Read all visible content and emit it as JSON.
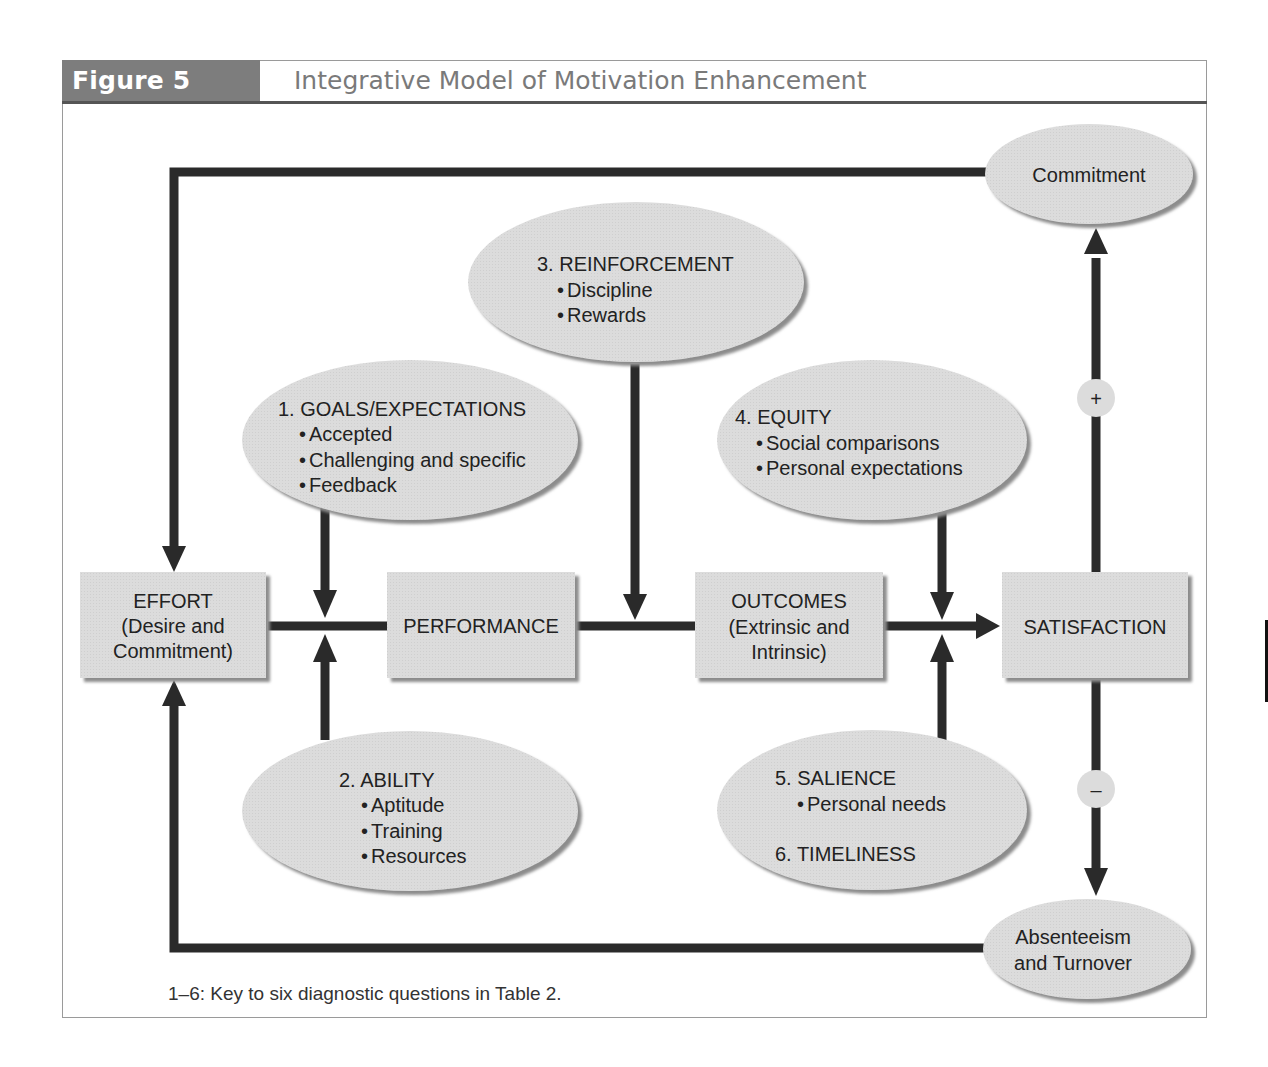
{
  "figure": {
    "label": "Figure 5",
    "title": "Integrative Model of Motivation Enhancement",
    "footnote": "1–6: Key to six diagnostic questions in Table 2."
  },
  "colors": {
    "node_fill": "#dcdcdc",
    "node_shadow": "#8c8c8c",
    "arrow": "#2a2a2a",
    "header_fill": "#7d7d7d",
    "title_text": "#7a7a7a"
  },
  "boxes": {
    "effort": {
      "lines": [
        "EFFORT",
        "(Desire and",
        "Commitment)"
      ]
    },
    "performance": {
      "lines": [
        "PERFORMANCE"
      ]
    },
    "outcomes": {
      "lines": [
        "OUTCOMES",
        "(Extrinsic and",
        "Intrinsic)"
      ]
    },
    "satisfaction": {
      "lines": [
        "SATISFACTION"
      ]
    }
  },
  "ellipses": {
    "commitment": {
      "lines": [
        "Commitment"
      ]
    },
    "absenteeism": {
      "lines": [
        "Absenteeism",
        "and Turnover"
      ]
    },
    "goals": {
      "heading": "1. GOALS/EXPECTATIONS",
      "bullets": [
        "Accepted",
        "Challenging and specific",
        "Feedback"
      ]
    },
    "ability": {
      "heading": "2. ABILITY",
      "bullets": [
        "Aptitude",
        "Training",
        "Resources"
      ]
    },
    "reinforcement": {
      "heading": "3. REINFORCEMENT",
      "bullets": [
        "Discipline",
        "Rewards"
      ]
    },
    "equity": {
      "heading": "4. EQUITY",
      "bullets": [
        "Social comparisons",
        "Personal expectations"
      ]
    },
    "salience": {
      "heading": "5. SALIENCE",
      "bullets": [
        "Personal needs"
      ],
      "heading2": "6. TIMELINESS"
    }
  },
  "signs": {
    "positive": "+",
    "negative": "–"
  },
  "bullet_char": "•"
}
